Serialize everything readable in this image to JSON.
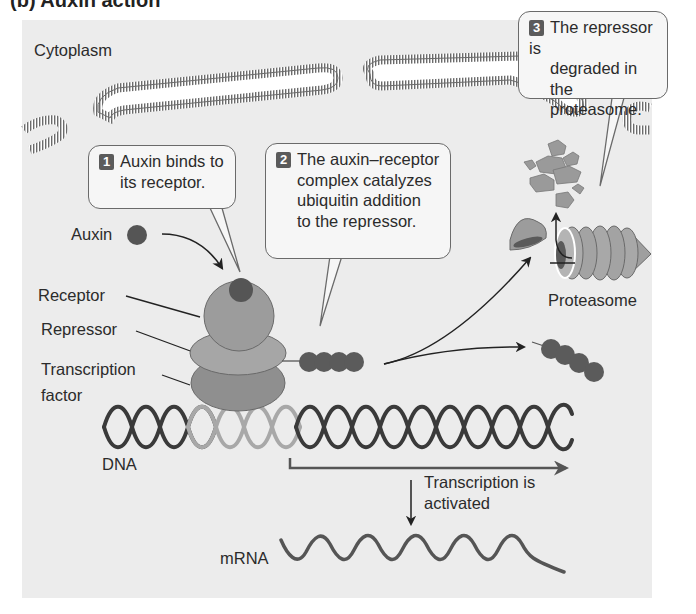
{
  "figure": {
    "heading_partial": "(b) Auxin action",
    "compartment_label": "Cytoplasm",
    "colors": {
      "background": "#ececec",
      "callout_fill": "#f6f6f6",
      "dark_molecule": "#555555",
      "protein_mid": "#9a9a9a",
      "protein_light": "#b0b0b0",
      "dna_dark": "#3a3a3a",
      "dna_light": "#a8a8a8",
      "membrane": "#6b6b6b"
    }
  },
  "callouts": [
    {
      "step": "1",
      "lines": [
        "Auxin binds to",
        "its receptor."
      ]
    },
    {
      "step": "2",
      "lines": [
        "The auxin–receptor",
        "complex catalyzes",
        "ubiquitin addition",
        "to the repressor."
      ]
    },
    {
      "step": "3",
      "lines": [
        "The repressor is",
        "degraded in the",
        "proteasome."
      ]
    }
  ],
  "labels": {
    "auxin": "Auxin",
    "receptor": "Receptor",
    "repressor": "Repressor",
    "transcription_factor_1": "Transcription",
    "transcription_factor_2": "factor",
    "dna": "DNA",
    "proteasome": "Proteasome",
    "transcription_1": "Transcription is",
    "transcription_2": "activated",
    "mrna": "mRNA"
  }
}
